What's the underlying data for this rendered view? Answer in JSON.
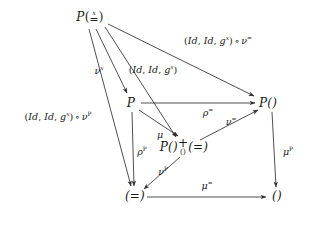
{
  "figure": {
    "kind": "commutative-diagram",
    "background": "#ffffff",
    "ink": "#1a1a1a"
  },
  "nodes": {
    "top_left": {
      "id": "P-x-eq",
      "label_parts": {
        "p": "P",
        "lparen": "(",
        "sup": "x",
        "base": "=",
        "rparen": ")"
      },
      "plain": "P(x=)",
      "x": 90,
      "y": 18
    },
    "mid_left": {
      "id": "P",
      "label": "P",
      "x": 131,
      "y": 103
    },
    "mid_right": {
      "id": "P-paren",
      "label": "P()",
      "x": 268,
      "y": 103
    },
    "center": {
      "id": "P-plus-eq",
      "left": "P()",
      "plus": "+",
      "plus_sub": "()",
      "right": "(=)",
      "plain": "P() + () (=)",
      "x": 184,
      "y": 147
    },
    "bottom_left": {
      "id": "eq",
      "label": "(=)",
      "x": 135,
      "y": 196
    },
    "bottom_right": {
      "id": "paren",
      "label": "()",
      "x": 277,
      "y": 196
    }
  },
  "edges": [
    {
      "name": "topleft-to-midright",
      "from": "top_left",
      "to": "mid_right",
      "label_plain": "(Id, Id, g^x) o v^=",
      "label": {
        "lparen": "(",
        "id1": "Id",
        "comma1": ", ",
        "id2": "Id",
        "comma2": ", ",
        "g": "g",
        "gsup": "x",
        "rparen": ")",
        "circ": "∘",
        "nu": "ν",
        "nusup": "="
      },
      "label_x": 218,
      "label_y": 41
    },
    {
      "name": "topleft-to-center",
      "from": "top_left",
      "to": "center",
      "label_plain": "(Id, Id, g^x)",
      "label": {
        "lparen": "(",
        "id1": "Id",
        "comma1": ", ",
        "id2": "Id",
        "comma2": ", ",
        "g": "g",
        "gsup": "x",
        "rparen": ")"
      },
      "label_x": 153,
      "label_y": 70
    },
    {
      "name": "topleft-to-midleft",
      "from": "top_left",
      "to": "mid_left",
      "label_plain": "v^x",
      "label": {
        "nu": "ν",
        "sup": "x"
      },
      "label_x": 99,
      "label_y": 71
    },
    {
      "name": "topleft-to-bottomleft",
      "from": "top_left",
      "to": "bottom_left",
      "label_plain": "(Id, Id, g^x) o v^P",
      "label": {
        "lparen": "(",
        "id1": "Id",
        "comma1": ", ",
        "id2": "Id",
        "comma2": ", ",
        "g": "g",
        "gsup": "x",
        "rparen": ")",
        "circ": "∘",
        "nu": "ν",
        "nusup": "P"
      },
      "label_x": 58,
      "label_y": 117
    },
    {
      "name": "midleft-to-midright",
      "from": "mid_left",
      "to": "mid_right",
      "label_plain": "rho^=",
      "label": {
        "sym": "ρ",
        "sup": "="
      },
      "label_x": 208,
      "label_y": 113
    },
    {
      "name": "midleft-to-center",
      "from": "mid_left",
      "to": "center",
      "label_plain": "mu",
      "label": {
        "sym": "μ",
        "sup": ""
      },
      "label_x": 160,
      "label_y": 135
    },
    {
      "name": "midleft-to-bottomleft",
      "from": "mid_left",
      "to": "bottom_left",
      "label_plain": "rho^P",
      "label": {
        "sym": "ρ",
        "sup": "P"
      },
      "label_x": 142,
      "label_y": 152
    },
    {
      "name": "center-to-midright",
      "from": "center",
      "to": "mid_right",
      "label_plain": "v^=",
      "label": {
        "sym": "ν",
        "sup": "="
      },
      "label_x": 231,
      "label_y": 122
    },
    {
      "name": "center-to-bottomleft",
      "from": "center",
      "to": "bottom_left",
      "label_plain": "v^P",
      "label": {
        "sym": "ν",
        "sup": "P"
      },
      "label_x": 163,
      "label_y": 172
    },
    {
      "name": "midright-to-bottomright",
      "from": "mid_right",
      "to": "bottom_right",
      "label_plain": "mu^P",
      "label": {
        "sym": "μ",
        "sup": "P"
      },
      "label_x": 288,
      "label_y": 152
    },
    {
      "name": "bottomleft-to-bottomright",
      "from": "bottom_left",
      "to": "bottom_right",
      "label_plain": "mu^=",
      "label": {
        "sym": "μ",
        "sup": "="
      },
      "label_x": 207,
      "label_y": 186
    }
  ]
}
